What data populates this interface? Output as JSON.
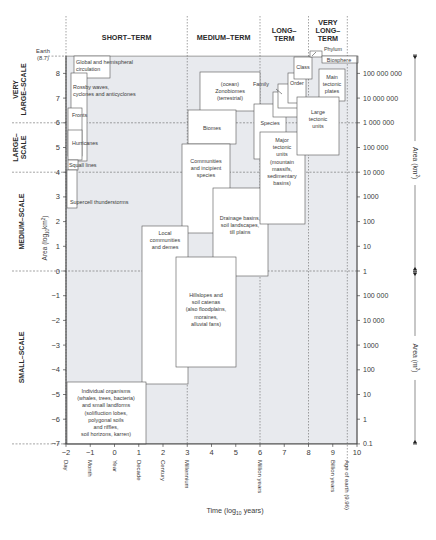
{
  "chart_data": {
    "type": "diagram",
    "title": "",
    "xlabel": "Time (log10 years)",
    "ylabel_left": "Area (log10 km2)",
    "ylabel_right_upper": "Area (km2)",
    "ylabel_right_lower": "Area (m2)",
    "x_ticks": [
      -2,
      -1,
      0,
      1,
      2,
      3,
      4,
      5,
      6,
      7,
      8,
      9,
      10
    ],
    "y_ticks": [
      8,
      7,
      6,
      5,
      4,
      3,
      2,
      1,
      0,
      -1,
      -2,
      -3,
      -4,
      -5,
      -6,
      -7
    ],
    "xlim": [
      -2,
      10
    ],
    "ylim": [
      -7,
      8.7
    ],
    "top_label": {
      "text1": "Earth",
      "text2": "(8.7)"
    },
    "time_categories": [
      {
        "label": "SHORT–TERM",
        "lines": [
          "SHORT–TERM"
        ],
        "from": -2,
        "to": 3
      },
      {
        "label": "MEDIUM–TERM",
        "lines": [
          "MEDIUM–TERM"
        ],
        "from": 3,
        "to": 6
      },
      {
        "label": "LONG–TERM",
        "lines": [
          "LONG–",
          "TERM"
        ],
        "from": 6,
        "to": 8
      },
      {
        "label": "VERY LONG–TERM",
        "lines": [
          "VERY",
          "LONG–",
          "TERM"
        ],
        "from": 8,
        "to": 9.6
      }
    ],
    "space_categories": [
      {
        "label": "VERY LARGE–SCALE",
        "lines": [
          "VERY",
          "LARGE–SCALE"
        ],
        "from": 6,
        "to": 8.7
      },
      {
        "label": "LARGE–SCALE",
        "lines": [
          "LARGE–",
          "SCALE"
        ],
        "from": 4,
        "to": 6
      },
      {
        "label": "MEDIUM–SCALE",
        "lines": [
          "MEDIUM–SCALE"
        ],
        "from": 0,
        "to": 4
      },
      {
        "label": "SMALL–SCALE",
        "lines": [
          "SMALL–SCALE"
        ],
        "from": -7,
        "to": 0
      }
    ],
    "time_annotations": [
      {
        "x": -2,
        "label": "Day"
      },
      {
        "x": -1,
        "label": "Month"
      },
      {
        "x": 0,
        "label": "Year"
      },
      {
        "x": 1,
        "label": "Decade"
      },
      {
        "x": 2,
        "label": "Century"
      },
      {
        "x": 3,
        "label": "Millennium"
      },
      {
        "x": 6,
        "label": "Million years"
      },
      {
        "x": 9,
        "label": "Billion years"
      },
      {
        "x": 9.6,
        "label": "Age of earth (9.96)"
      }
    ],
    "right_km2_ticks": [
      {
        "y": 8,
        "label": "100 000 000"
      },
      {
        "y": 7,
        "label": "10 000 000"
      },
      {
        "y": 6,
        "label": "1 000 000"
      },
      {
        "y": 5,
        "label": "100 000"
      },
      {
        "y": 4,
        "label": "10 000"
      },
      {
        "y": 3,
        "label": "1000"
      },
      {
        "y": 2,
        "label": "100"
      },
      {
        "y": 1,
        "label": "10"
      },
      {
        "y": 0,
        "label": "1"
      }
    ],
    "right_m2_ticks": [
      {
        "y": -1,
        "label": "100 000"
      },
      {
        "y": -2,
        "label": "10 000"
      },
      {
        "y": -3,
        "label": "1000"
      },
      {
        "y": -4,
        "label": "100"
      },
      {
        "y": -5,
        "label": "10"
      },
      {
        "y": -6,
        "label": "1"
      },
      {
        "y": -7,
        "label": "0.1"
      }
    ],
    "phenomena": [
      {
        "name": "Global and hemispheral circulation",
        "lines": [
          "Global and hemispheral",
          "circulation"
        ],
        "box": [
          74,
          56,
          36,
          22
        ],
        "tx": 76,
        "ty": 64,
        "anchor": "start"
      },
      {
        "name": "Rossby waves, cyclones and anticyclones",
        "lines": [
          "Rossby waves,",
          "cyclones and anticyclones"
        ],
        "box": [
          71,
          73,
          16,
          88
        ],
        "tx": 73,
        "ty": 89,
        "anchor": "start"
      },
      {
        "name": "Fronts",
        "lines": [
          "Fronts"
        ],
        "box": [
          68,
          108,
          14,
          48
        ],
        "tx": 72,
        "ty": 117,
        "anchor": "start"
      },
      {
        "name": "Hurricanes",
        "lines": [
          "Hurricanes"
        ],
        "box": [
          68,
          130,
          14,
          30
        ],
        "tx": 72,
        "ty": 145,
        "anchor": "start"
      },
      {
        "name": "Squall lines",
        "lines": [
          "Squall lines"
        ],
        "box": [
          68,
          160,
          10,
          10
        ],
        "tx": 69,
        "ty": 167,
        "anchor": "start"
      },
      {
        "name": "Supercell thunderstorms",
        "lines": [
          "Supercell thunderstorms"
        ],
        "box": [
          67,
          170,
          10,
          38
        ],
        "tx": 70,
        "ty": 204,
        "anchor": "start"
      },
      {
        "name": "(ocean) Zonobiomes (terrestrial)",
        "lines": [
          "(ocean)",
          "Zonobiomes",
          "(terrestrial)"
        ],
        "box": [
          200,
          72,
          60,
          39
        ],
        "tx": 230,
        "ty": 86,
        "anchor": "middle"
      },
      {
        "name": "Biomes",
        "lines": [
          "Biomes"
        ],
        "box": [
          188,
          110,
          48,
          34
        ],
        "tx": 212,
        "ty": 130,
        "anchor": "middle"
      },
      {
        "name": "Communities and incipient species",
        "lines": [
          "Communities",
          "and incipient",
          "species"
        ],
        "box": [
          182,
          144,
          48,
          89
        ],
        "tx": 206,
        "ty": 163,
        "anchor": "middle"
      },
      {
        "name": "Drainage basins, soil landscapes, till plains",
        "lines": [
          "Drainage basins,",
          "soil landscapes,",
          "till plains"
        ],
        "box": [
          213,
          188,
          55,
          88
        ],
        "tx": 240,
        "ty": 220,
        "anchor": "middle"
      },
      {
        "name": "Local communities and demes",
        "lines": [
          "Local",
          "communities",
          "and demes"
        ],
        "box": [
          142,
          226,
          46,
          158
        ],
        "tx": 165,
        "ty": 235,
        "anchor": "middle"
      },
      {
        "name": "Hillslopes and soil catenas (also floodplains, moraines, alluvial fans)",
        "lines": [
          "Hillslopes and",
          "soil catenas",
          "(also floodplains,",
          "moraines,",
          "alluvial fans)"
        ],
        "box": [
          176,
          257,
          60,
          110
        ],
        "tx": 206,
        "ty": 297,
        "anchor": "middle"
      },
      {
        "name": "Individual organisms (whales, trees, bacteria) and small landforms (solifluction lobes, polygonal soils and riffles, soil horizons, karren)",
        "lines": [
          "Individual organisms",
          "(whales, trees, bacteria)",
          "and small landforms",
          "(solifluction lobes,",
          "polygonal soils",
          "and riffles,",
          "soil horizons, karren)"
        ],
        "box": [
          67,
          382,
          79,
          62
        ],
        "tx": 106,
        "ty": 393,
        "anchor": "middle"
      },
      {
        "name": "Species",
        "lines": [
          "Species"
        ],
        "box": [
          254,
          104,
          32,
          55
        ],
        "tx": 270,
        "ty": 125,
        "anchor": "middle"
      },
      {
        "name": "Major tectonic units (mountain massifs, sedimentary basins)",
        "lines": [
          "Major",
          "tectonic",
          "units",
          "(mountain",
          "massifs,",
          "sedimentary",
          "basins)"
        ],
        "box": [
          260,
          132,
          45,
          92
        ],
        "tx": 282,
        "ty": 142,
        "anchor": "middle"
      },
      {
        "name": "Genus",
        "lines": [
          "Genus"
        ],
        "box": [
          273,
          92,
          26,
          25
        ],
        "tx": 286,
        "ty": 108,
        "anchor": "middle"
      },
      {
        "name": "Family",
        "lines": [
          "Family"
        ],
        "box": [
          278,
          84,
          23,
          24
        ],
        "tx": 261,
        "ty": 86,
        "anchor": "middle"
      },
      {
        "name": "Order",
        "lines": [
          "Order"
        ],
        "box": [
          288,
          73,
          18,
          30
        ],
        "tx": 297,
        "ty": 85,
        "anchor": "middle"
      },
      {
        "name": "Class",
        "lines": [
          "Class"
        ],
        "box": [
          294,
          57,
          18,
          22
        ],
        "tx": 303,
        "ty": 69,
        "anchor": "middle"
      },
      {
        "name": "Phylum",
        "lines": [
          "Phylum"
        ],
        "box": [
          310,
          51,
          12,
          6
        ],
        "tx": 333,
        "ty": 51,
        "anchor": "middle"
      },
      {
        "name": "Biosphere",
        "lines": [
          "Biosphere"
        ],
        "box": [
          322,
          56,
          36,
          7
        ],
        "tx": 339,
        "ty": 62,
        "anchor": "middle"
      },
      {
        "name": "Main tectonic plates",
        "lines": [
          "Main",
          "tectonic",
          "plates"
        ],
        "box": [
          319,
          69,
          26,
          32
        ],
        "tx": 332,
        "ty": 79,
        "anchor": "middle"
      },
      {
        "name": "Large tectonic units",
        "lines": [
          "Large",
          "tectonic",
          "units"
        ],
        "box": [
          297,
          97,
          42,
          58
        ],
        "tx": 318,
        "ty": 114,
        "anchor": "middle"
      }
    ],
    "colors": {
      "plot_fill": "#e8eaee",
      "box_fill": "#ffffff",
      "line": "#555555",
      "text": "#3a3a3a"
    }
  }
}
